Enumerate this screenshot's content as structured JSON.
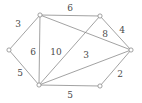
{
  "figure": {
    "kind": "weighted-undirected-graph",
    "width": 142,
    "height": 103,
    "background_color": "#ffffff",
    "stroke_color": "#8a8a8a",
    "label_color": "#4a4a4a"
  },
  "chart_data": {
    "type": "diagram",
    "title": "",
    "xlabel": "",
    "ylabel": "",
    "nodes": [
      {
        "id": "A",
        "label": "",
        "x": 40,
        "y": 15
      },
      {
        "id": "B",
        "label": "",
        "x": 100,
        "y": 16
      },
      {
        "id": "C",
        "label": "",
        "x": 131,
        "y": 50
      },
      {
        "id": "D",
        "label": "",
        "x": 100,
        "y": 86
      },
      {
        "id": "E",
        "label": "",
        "x": 39,
        "y": 85
      },
      {
        "id": "F",
        "label": "",
        "x": 9,
        "y": 50
      }
    ],
    "edges": [
      {
        "from": "A",
        "to": "B",
        "weight": "6",
        "label_x": 70,
        "label_y": 8
      },
      {
        "from": "A",
        "to": "F",
        "weight": "3",
        "label_x": 18,
        "label_y": 24
      },
      {
        "from": "A",
        "to": "E",
        "weight": "6",
        "label_x": 33,
        "label_y": 52
      },
      {
        "from": "A",
        "to": "C",
        "weight": "10",
        "label_x": 56,
        "label_y": 52
      },
      {
        "from": "F",
        "to": "E",
        "weight": "5",
        "label_x": 20,
        "label_y": 73
      },
      {
        "from": "B",
        "to": "C",
        "weight": "4",
        "label_x": 122,
        "label_y": 30
      },
      {
        "from": "B",
        "to": "E",
        "weight": "8",
        "label_x": 105,
        "label_y": 34
      },
      {
        "from": "C",
        "to": "E",
        "weight": "3",
        "label_x": 86,
        "label_y": 55
      },
      {
        "from": "C",
        "to": "D",
        "weight": "2",
        "label_x": 120,
        "label_y": 74
      },
      {
        "from": "D",
        "to": "E",
        "weight": "5",
        "label_x": 70,
        "label_y": 95
      }
    ],
    "weights": [
      "6",
      "3",
      "6",
      "10",
      "5",
      "4",
      "8",
      "3",
      "2",
      "5"
    ]
  }
}
